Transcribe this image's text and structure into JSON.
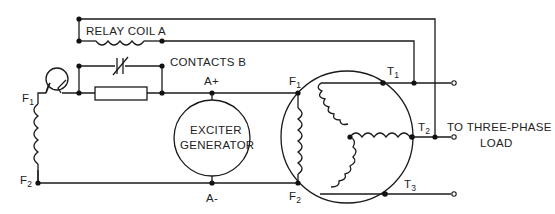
{
  "diagram": {
    "labels": {
      "relay_coil": "RELAY COIL A",
      "contacts": "CONTACTS B",
      "exciter_line1": "EXCITER",
      "exciter_line2": "GENERATOR",
      "a_plus": "A+",
      "a_minus": "A-",
      "left_f1": "F",
      "left_f1_sub": "1",
      "left_f2": "F",
      "left_f2_sub": "2",
      "gen_f1": "F",
      "gen_f1_sub": "1",
      "gen_f2": "F",
      "gen_f2_sub": "2",
      "t1": "T",
      "t1_sub": "1",
      "t2": "T",
      "t2_sub": "2",
      "t3": "T",
      "t3_sub": "3",
      "load_line1": "TO THREE-PHASE",
      "load_line2": "LOAD"
    },
    "components": [
      {
        "id": "relay-coil-a",
        "type": "inductor"
      },
      {
        "id": "contacts-b",
        "type": "normally-closed-contact"
      },
      {
        "id": "lamp",
        "type": "lamp"
      },
      {
        "id": "resistor",
        "type": "resistor"
      },
      {
        "id": "shunt-field-coil",
        "type": "inductor"
      },
      {
        "id": "exciter-generator",
        "type": "generator"
      },
      {
        "id": "alternator-field-coil",
        "type": "inductor"
      },
      {
        "id": "wye-stator-windings",
        "type": "three-phase-wye"
      }
    ],
    "colors": {
      "line": "#1a1a1a",
      "background": "#ffffff"
    }
  }
}
